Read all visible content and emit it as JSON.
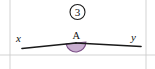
{
  "figure": {
    "problem_number": "3",
    "badge_label": "3",
    "vertex_label": "A",
    "left_ray_label": "x",
    "right_ray_label": "y",
    "colors": {
      "angle_fill": "#c9aed0",
      "angle_stroke": "#7b4f86",
      "line": "#1a1a1a",
      "grid": "#c8c8c8",
      "background": "#ffffff"
    },
    "geometry": {
      "vertex": {
        "x": 76,
        "y": 43
      },
      "left_endpoint": {
        "x": 22,
        "y": 48.5
      },
      "right_endpoint": {
        "x": 141,
        "y": 46.5
      },
      "angle_radius": 10,
      "angle_measure_degrees": 180,
      "badge_center": {
        "x": 77.5,
        "y": 12
      },
      "badge_radius": 7.5
    },
    "grid": {
      "vertical_lines_x": [
        10,
        146
      ],
      "horizontal_lines_y": [
        55
      ]
    }
  }
}
